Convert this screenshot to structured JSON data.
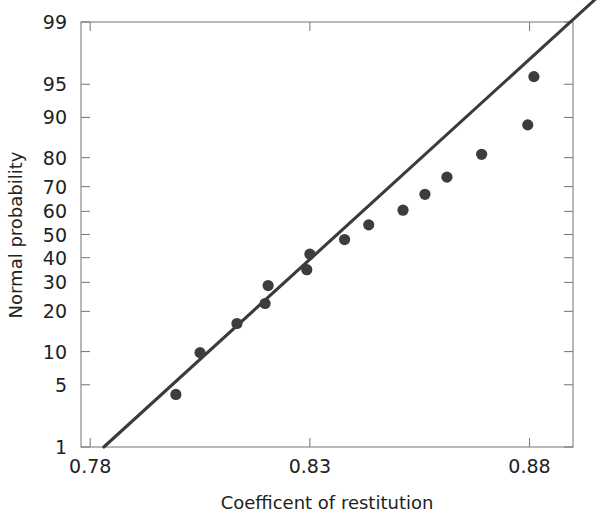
{
  "chart_data": {
    "type": "scatter",
    "title": "",
    "xlabel": "Coefficent of restitution",
    "ylabel": "Normal probability",
    "xlim": [
      0.7779,
      0.8899
    ],
    "ylim": [
      1,
      99
    ],
    "y_scale": "normal-probability",
    "grid": false,
    "legend": "none",
    "xticks": [
      0.78,
      0.83,
      0.88
    ],
    "xtick_labels": [
      "0.78",
      "0.83",
      "0.88"
    ],
    "yticks": [
      1,
      5,
      10,
      20,
      30,
      40,
      50,
      60,
      70,
      80,
      90,
      95,
      99
    ],
    "ytick_labels": [
      "1",
      "5",
      "10",
      "20",
      "30",
      "40",
      "50",
      "60",
      "70",
      "80",
      "90",
      "95",
      "99"
    ],
    "points": [
      {
        "x": 0.7995,
        "y": 4.0
      },
      {
        "x": 0.805,
        "y": 9.8
      },
      {
        "x": 0.8134,
        "y": 16.5
      },
      {
        "x": 0.8198,
        "y": 22.5
      },
      {
        "x": 0.8205,
        "y": 28.8
      },
      {
        "x": 0.8293,
        "y": 35.0
      },
      {
        "x": 0.83,
        "y": 41.5
      },
      {
        "x": 0.8379,
        "y": 47.8
      },
      {
        "x": 0.8434,
        "y": 54.2
      },
      {
        "x": 0.8512,
        "y": 60.5
      },
      {
        "x": 0.8562,
        "y": 67.0
      },
      {
        "x": 0.8612,
        "y": 73.5
      },
      {
        "x": 0.8691,
        "y": 81.0
      },
      {
        "x": 0.8796,
        "y": 88.5
      },
      {
        "x": 0.881,
        "y": 95.8
      }
    ],
    "fit_line": {
      "label": "reference line",
      "x_start": 0.7831,
      "y_start": 1.0,
      "x_end": 0.895,
      "y_end": 99.5
    },
    "point_color": "#3d3d3f",
    "line_color": "#3b3b3d",
    "axis_color": "#7d7f82",
    "text_color": "#222222",
    "background_color": "#ffffff"
  }
}
